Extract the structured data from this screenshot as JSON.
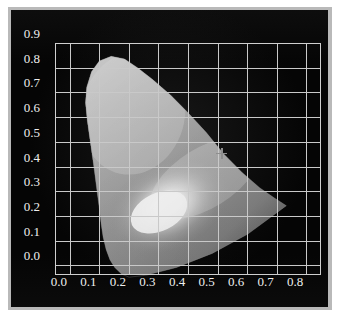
{
  "figure": {
    "kind": "cie-1931-chromaticity-diagram",
    "background_color": "#ffffff",
    "plate_color": "#050505",
    "frame_color": "#b9b9b9",
    "grid_color": "#c9c9c9",
    "label_color": "#efefef",
    "marker_color": "#8e8e8e"
  },
  "chart_data": {
    "type": "scatter",
    "title": "",
    "xlabel": "",
    "ylabel": "",
    "xlim": [
      -0.05,
      0.85
    ],
    "ylim": [
      -0.0385,
      0.9
    ],
    "grid": true,
    "legend": false,
    "x_ticks": [
      "0.0",
      "0.1",
      "0.2",
      "0.3",
      "0.4",
      "0.5",
      "0.6",
      "0.7",
      "0.8"
    ],
    "x_tick_values": [
      0.0,
      0.1,
      0.2,
      0.3,
      0.4,
      0.5,
      0.6,
      0.7,
      0.8
    ],
    "y_ticks": [
      "0.0",
      "0.1",
      "0.2",
      "0.3",
      "0.4",
      "0.5",
      "0.6",
      "0.7",
      "0.8",
      "0.9"
    ],
    "y_tick_values": [
      0.0,
      0.1,
      0.2,
      0.3,
      0.4,
      0.5,
      0.6,
      0.7,
      0.8,
      0.9
    ],
    "annotations": [
      {
        "name": "white-point-marker",
        "glyph": "plus-cross",
        "x": 0.515,
        "y": 0.455,
        "label": ""
      }
    ],
    "gamut_outline": {
      "name": "spectral-locus",
      "description": "CIE 1931 horseshoe locus; grayscale rendering, brightest near the white point region.",
      "points": [
        [
          0.175,
          0.005
        ],
        [
          0.152,
          0.03
        ],
        [
          0.136,
          0.06
        ],
        [
          0.123,
          0.1
        ],
        [
          0.113,
          0.148
        ],
        [
          0.106,
          0.2
        ],
        [
          0.1,
          0.26
        ],
        [
          0.092,
          0.33
        ],
        [
          0.082,
          0.42
        ],
        [
          0.071,
          0.51
        ],
        [
          0.06,
          0.6
        ],
        [
          0.054,
          0.67
        ],
        [
          0.058,
          0.73
        ],
        [
          0.074,
          0.79
        ],
        [
          0.1,
          0.832
        ],
        [
          0.14,
          0.85
        ],
        [
          0.185,
          0.84
        ],
        [
          0.23,
          0.805
        ],
        [
          0.28,
          0.76
        ],
        [
          0.34,
          0.7
        ],
        [
          0.4,
          0.63
        ],
        [
          0.46,
          0.555
        ],
        [
          0.52,
          0.47
        ],
        [
          0.58,
          0.4
        ],
        [
          0.64,
          0.34
        ],
        [
          0.69,
          0.3
        ],
        [
          0.73,
          0.27
        ],
        [
          0.6,
          0.16
        ],
        [
          0.48,
          0.085
        ],
        [
          0.36,
          0.03
        ],
        [
          0.26,
          0.0
        ],
        [
          0.2,
          -0.008
        ],
        [
          0.175,
          0.005
        ]
      ]
    },
    "bright_region": {
      "name": "white-highlight",
      "center": [
        0.33,
        0.27
      ],
      "description": "Brightest area of grayscale gradient inside the gamut"
    }
  }
}
